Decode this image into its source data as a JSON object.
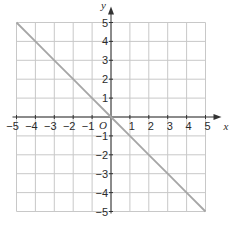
{
  "chart_data": {
    "type": "line",
    "title": "",
    "xlabel": "x",
    "ylabel": "y",
    "origin_label": "O",
    "xlim": [
      -5,
      5
    ],
    "ylim": [
      -5,
      5
    ],
    "grid": true,
    "x_ticks": [
      -5,
      -4,
      -3,
      -2,
      -1,
      1,
      2,
      3,
      4,
      5
    ],
    "y_ticks": [
      5,
      4,
      3,
      2,
      1,
      -1,
      -2,
      -3,
      -4,
      -5
    ],
    "series": [
      {
        "name": "y = -x",
        "x": [
          -5,
          -4,
          -3,
          -2,
          -1,
          0,
          1,
          2,
          3,
          4,
          5
        ],
        "y": [
          5,
          4,
          3,
          2,
          1,
          0,
          -1,
          -2,
          -3,
          -4,
          -5
        ],
        "color": "#a6a6a6"
      }
    ],
    "colors": {
      "grid": "#c8c8c8",
      "axis": "#333333",
      "line": "#a6a6a6"
    }
  }
}
